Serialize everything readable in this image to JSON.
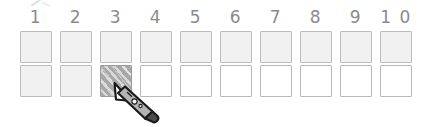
{
  "worksheet": {
    "title": "number-grid-worksheet",
    "columns": [
      {
        "label": "1"
      },
      {
        "label": "2"
      },
      {
        "label": "3"
      },
      {
        "label": "4"
      },
      {
        "label": "5"
      },
      {
        "label": "6"
      },
      {
        "label": "7"
      },
      {
        "label": "8"
      },
      {
        "label": "9"
      },
      {
        "label": "1 0"
      }
    ],
    "rows": [
      {
        "name": "row-top",
        "cells": [
          {
            "state": "light"
          },
          {
            "state": "light"
          },
          {
            "state": "light"
          },
          {
            "state": "light"
          },
          {
            "state": "light"
          },
          {
            "state": "light"
          },
          {
            "state": "light"
          },
          {
            "state": "light"
          },
          {
            "state": "light"
          },
          {
            "state": "light"
          }
        ]
      },
      {
        "name": "row-bottom",
        "cells": [
          {
            "state": "light"
          },
          {
            "state": "light"
          },
          {
            "state": "hatched"
          },
          {
            "state": "empty"
          },
          {
            "state": "empty"
          },
          {
            "state": "empty"
          },
          {
            "state": "empty"
          },
          {
            "state": "empty"
          },
          {
            "state": "empty"
          },
          {
            "state": "empty"
          }
        ]
      }
    ]
  },
  "cursor": {
    "icon": "pencil-cursor",
    "x": 112,
    "y": 80
  },
  "colors": {
    "background": "#ffffff",
    "box_border": "#b9b9b9",
    "box_fill_light": "#f1f1f1",
    "box_fill_empty": "#ffffff",
    "box_fill_hatched": "#a8a8a8",
    "number_text": "#8b8b8b"
  }
}
